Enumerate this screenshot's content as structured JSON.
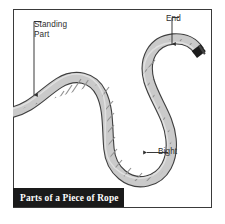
{
  "figure": {
    "caption": "Parts of a Piece of Rope",
    "background_color": "#ffffff",
    "border_color": "#3a3a3a",
    "caption_bar_color": "#1a1a1a",
    "caption_text_color": "#ffffff"
  },
  "rope": {
    "fill_color": "#c9c9c9",
    "outline_color": "#3f3f3f",
    "strand_color": "#8a8a8a",
    "tip_color": "#1c1c1c",
    "shape": "s-curve-with-bight"
  },
  "annotations": [
    {
      "id": "standing-part",
      "label": "Standing\nPart",
      "leader": "elbow-down",
      "arrow_direction": "down"
    },
    {
      "id": "end",
      "label": "End",
      "leader": "elbow-down",
      "arrow_direction": "down"
    },
    {
      "id": "bight",
      "label": "Bight",
      "leader": "straight",
      "arrow_direction": "left"
    }
  ]
}
